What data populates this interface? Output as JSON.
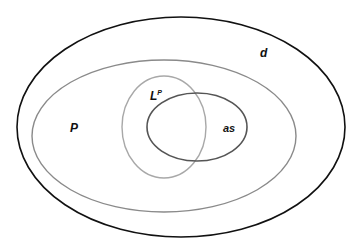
{
  "diagram": {
    "type": "nested-venn",
    "sets": [
      {
        "id": "d",
        "label": "d",
        "color": "#111111",
        "cx": 181,
        "cy": 127,
        "rx": 164,
        "ry": 110,
        "stroke_width": 1.6,
        "label_x": 260,
        "label_y": 57
      },
      {
        "id": "P",
        "label": "P",
        "color": "#8a8a8a",
        "cx": 164,
        "cy": 136,
        "rx": 132,
        "ry": 76,
        "stroke_width": 1.4,
        "label_x": 70,
        "label_y": 132
      },
      {
        "id": "Lp",
        "label": "L",
        "superscript": "P",
        "color": "#a8a8a8",
        "cx": 164,
        "cy": 127,
        "rx": 42,
        "ry": 51,
        "stroke_width": 1.4,
        "label_x": 150,
        "label_y": 100
      },
      {
        "id": "as",
        "label": "as",
        "color": "#555555",
        "cx": 197,
        "cy": 127,
        "rx": 50,
        "ry": 34,
        "stroke_width": 1.6,
        "label_x": 223,
        "label_y": 132
      }
    ]
  }
}
